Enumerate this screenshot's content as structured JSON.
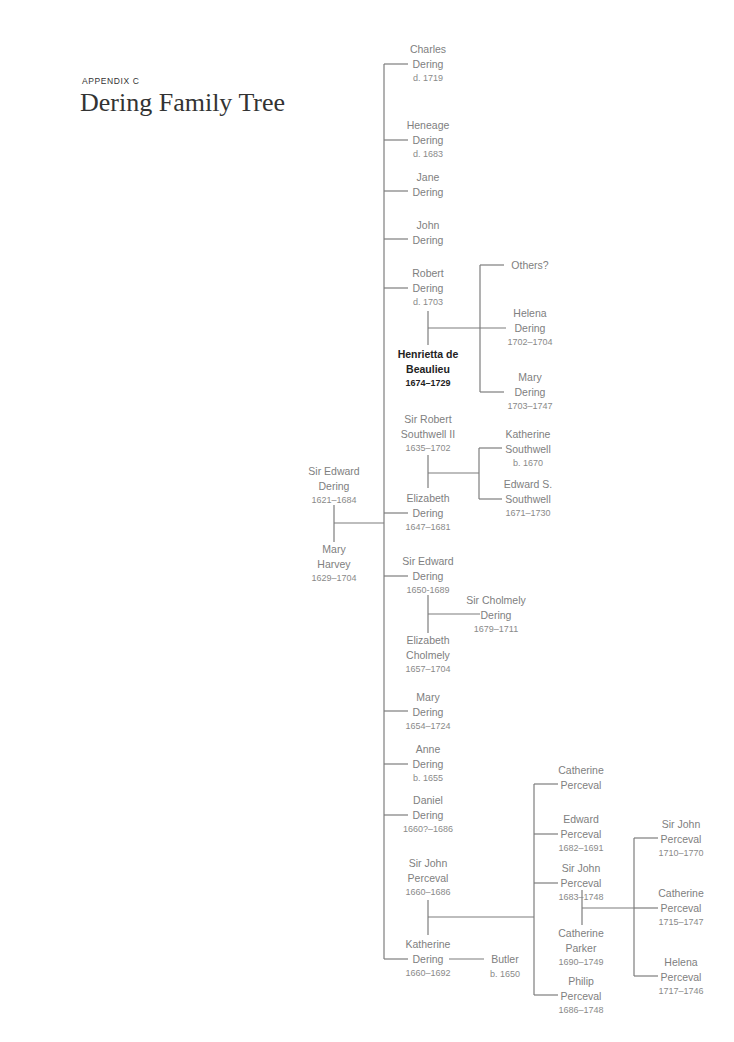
{
  "header": {
    "eyebrow": "APPENDIX C",
    "title": "Dering Family Tree"
  },
  "colors": {
    "line": "#7d7d7d",
    "text": "#808080",
    "highlight": "#222222"
  },
  "root_couple": {
    "husband": {
      "name1": "Sir Edward",
      "name2": "Dering",
      "dates": "1621–1684"
    },
    "wife": {
      "name1": "Mary",
      "name2": "Harvey",
      "dates": "1629–1704"
    }
  },
  "children": [
    {
      "name1": "Charles",
      "name2": "Dering",
      "dates": "d. 1719"
    },
    {
      "name1": "Heneage",
      "name2": "Dering",
      "dates": "d. 1683"
    },
    {
      "name1": "Jane",
      "name2": "Dering",
      "dates": ""
    },
    {
      "name1": "John",
      "name2": "Dering",
      "dates": ""
    },
    {
      "name1": "Robert",
      "name2": "Dering",
      "dates": "d. 1703",
      "spouse": {
        "name1": "Henrietta de",
        "name2": "Beaulieu",
        "dates": "1674–1729",
        "highlighted": true
      },
      "offspring": [
        {
          "name1": "Others?",
          "name2": "",
          "dates": ""
        },
        {
          "name1": "Helena",
          "name2": "Dering",
          "dates": "1702–1704"
        },
        {
          "name1": "Mary",
          "name2": "Dering",
          "dates": "1703–1747"
        }
      ]
    },
    {
      "name1": "Elizabeth",
      "name2": "Dering",
      "dates": "1647–1681",
      "spouse": {
        "name1": "Sir Robert",
        "name2": "Southwell II",
        "dates": "1635–1702"
      },
      "offspring": [
        {
          "name1": "Katherine",
          "name2": "Southwell",
          "dates": "b. 1670"
        },
        {
          "name1": "Edward S.",
          "name2": "Southwell",
          "dates": "1671–1730"
        }
      ]
    },
    {
      "name1": "Sir Edward",
      "name2": "Dering",
      "dates": "1650-1689",
      "spouse": {
        "name1": "Elizabeth",
        "name2": "Cholmely",
        "dates": "1657–1704"
      },
      "offspring": [
        {
          "name1": "Sir Cholmely",
          "name2": "Dering",
          "dates": "1679–1711"
        }
      ]
    },
    {
      "name1": "Mary",
      "name2": "Dering",
      "dates": "1654–1724"
    },
    {
      "name1": "Anne",
      "name2": "Dering",
      "dates": "b. 1655"
    },
    {
      "name1": "Daniel",
      "name2": "Dering",
      "dates": "1660?–1686"
    },
    {
      "name1": "Katherine",
      "name2": "Dering",
      "dates": "1660–1692",
      "spouse": {
        "name1": "Sir John",
        "name2": "Perceval",
        "dates": "1660–1686"
      },
      "second_spouse": {
        "name1": "Butler",
        "dates": "b. 1650"
      },
      "offspring": [
        {
          "name1": "Catherine",
          "name2": "Perceval",
          "dates": ""
        },
        {
          "name1": "Edward",
          "name2": "Perceval",
          "dates": "1682–1691"
        },
        {
          "name1": "Sir John",
          "name2": "Perceval",
          "dates": "1683–1748",
          "spouse": {
            "name1": "Catherine",
            "name2": "Parker",
            "dates": "1690–1749"
          },
          "offspring": [
            {
              "name1": "Sir John",
              "name2": "Perceval",
              "dates": "1710–1770"
            },
            {
              "name1": "Catherine",
              "name2": "Perceval",
              "dates": "1715–1747"
            },
            {
              "name1": "Helena",
              "name2": "Perceval",
              "dates": "1717–1746"
            }
          ]
        },
        {
          "name1": "Philip",
          "name2": "Perceval",
          "dates": "1686–1748"
        }
      ]
    }
  ]
}
